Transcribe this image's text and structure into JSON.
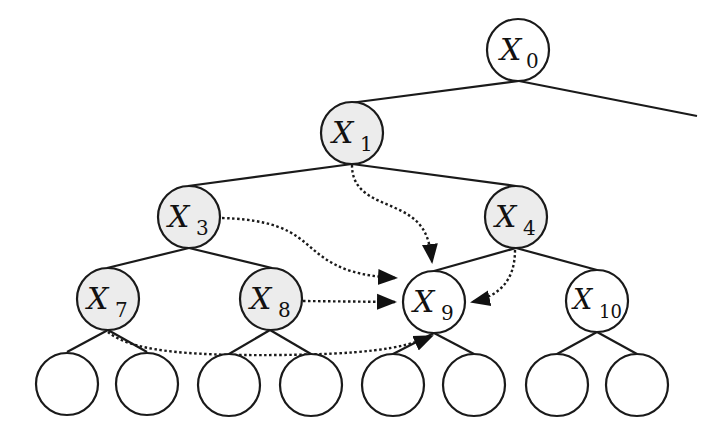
{
  "diagram": {
    "type": "tree",
    "colors": {
      "shaded_fill": "#ececec",
      "plain_fill": "#ffffff",
      "stroke": "#1a1a1a"
    },
    "nodes": [
      {
        "id": "X0",
        "letter": "X",
        "sub": "0",
        "shaded": false
      },
      {
        "id": "X1",
        "letter": "X",
        "sub": "1",
        "shaded": true
      },
      {
        "id": "X3",
        "letter": "X",
        "sub": "3",
        "shaded": true
      },
      {
        "id": "X4",
        "letter": "X",
        "sub": "4",
        "shaded": true
      },
      {
        "id": "X7",
        "letter": "X",
        "sub": "7",
        "shaded": true
      },
      {
        "id": "X8",
        "letter": "X",
        "sub": "8",
        "shaded": true
      },
      {
        "id": "X9",
        "letter": "X",
        "sub": "9",
        "shaded": false
      },
      {
        "id": "X10",
        "letter": "X",
        "sub": "10",
        "shaded": false
      }
    ],
    "leaf_count": 8,
    "tree_edges": [
      [
        "X0",
        "X1"
      ],
      [
        "X0",
        "(offscreen-right)"
      ],
      [
        "X1",
        "X3"
      ],
      [
        "X1",
        "X4"
      ],
      [
        "X3",
        "X7"
      ],
      [
        "X3",
        "X8"
      ],
      [
        "X4",
        "X9"
      ],
      [
        "X4",
        "X10"
      ],
      [
        "X7",
        "leaf1"
      ],
      [
        "X7",
        "leaf2"
      ],
      [
        "X8",
        "leaf3"
      ],
      [
        "X8",
        "leaf4"
      ],
      [
        "X9",
        "leaf5"
      ],
      [
        "X9",
        "leaf6"
      ],
      [
        "X10",
        "leaf7"
      ],
      [
        "X10",
        "leaf8"
      ]
    ],
    "dotted_arrows": [
      [
        "X1",
        "X9"
      ],
      [
        "X3",
        "X9"
      ],
      [
        "X4",
        "X9"
      ],
      [
        "X7",
        "X9"
      ],
      [
        "X8",
        "X9"
      ]
    ]
  }
}
